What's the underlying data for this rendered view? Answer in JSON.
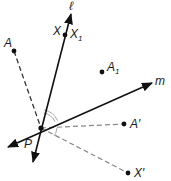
{
  "diagram": {
    "type": "geometry-reflection",
    "colors": {
      "line": "#111111",
      "dashed": "#888888",
      "arc": "#aaaaaa",
      "point": "#111111"
    },
    "lines": [
      {
        "name": "l",
        "label": "ℓ",
        "from": [
          33,
          162
        ],
        "to": [
          71,
          14
        ]
      },
      {
        "name": "m",
        "label": "m",
        "from": [
          8,
          147
        ],
        "to": [
          152,
          83
        ]
      }
    ],
    "points": [
      {
        "name": "A",
        "label": "A",
        "x": 14,
        "y": 51
      },
      {
        "name": "X",
        "label": "X",
        "x": 65,
        "y": 35
      },
      {
        "name": "A1",
        "label": "A",
        "sub": "1",
        "x": 102,
        "y": 72
      },
      {
        "name": "A-prime",
        "label": "A′",
        "x": 124,
        "y": 124
      },
      {
        "name": "X-prime",
        "label": "X′",
        "x": 128,
        "y": 173
      },
      {
        "name": "P",
        "label": "P",
        "x": 41,
        "y": 128
      }
    ],
    "labels": {
      "l": "ℓ",
      "m": "m",
      "A": "A",
      "X": "X",
      "X1_main": "X",
      "X1_sub": "1",
      "A1_main": "A",
      "A1_sub": "1",
      "A_prime": "A′",
      "X_prime": "X′",
      "P": "P"
    }
  }
}
